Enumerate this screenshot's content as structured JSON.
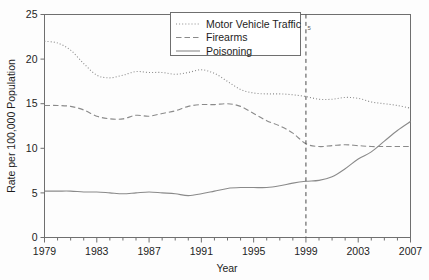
{
  "chart_data": {
    "type": "line",
    "title": "",
    "xlabel": "Year",
    "ylabel": "Rate per 100,000 Population",
    "xlim": [
      1979,
      2007
    ],
    "ylim": [
      0,
      25
    ],
    "grid": false,
    "legend_position": "top-center",
    "y_ticks": [
      "0",
      "5",
      "10",
      "15",
      "20",
      "25"
    ],
    "x_ticks_major": [
      "1979",
      "1983",
      "1987",
      "1991",
      "1995",
      "1999",
      "2003",
      "2007"
    ],
    "x_minor_tick_step": 1,
    "x": [
      1979,
      1980,
      1981,
      1982,
      1983,
      1984,
      1985,
      1986,
      1987,
      1988,
      1989,
      1990,
      1991,
      1992,
      1993,
      1994,
      1995,
      1996,
      1997,
      1998,
      1999,
      2000,
      2001,
      2002,
      2003,
      2004,
      2005,
      2006,
      2007
    ],
    "series": [
      {
        "name": "Motor Vehicle Traffic",
        "style": "dotted",
        "color": "#8a8a8a",
        "values": [
          22.0,
          21.8,
          21.0,
          19.5,
          18.2,
          17.9,
          18.2,
          18.6,
          18.5,
          18.5,
          18.3,
          18.5,
          18.8,
          18.4,
          17.5,
          16.6,
          16.2,
          16.1,
          16.1,
          16.0,
          15.8,
          15.5,
          15.5,
          15.7,
          15.6,
          15.2,
          15.0,
          14.8,
          14.5
        ]
      },
      {
        "name": "Firearms",
        "style": "dashed",
        "color": "#8a8a8a",
        "values": [
          14.8,
          14.8,
          14.7,
          14.3,
          13.6,
          13.3,
          13.3,
          13.7,
          13.6,
          13.9,
          14.2,
          14.7,
          14.9,
          14.9,
          15.0,
          14.7,
          13.9,
          13.1,
          12.5,
          11.7,
          10.5,
          10.2,
          10.3,
          10.4,
          10.3,
          10.2,
          10.2,
          10.2,
          10.2
        ]
      },
      {
        "name": "Poisoning",
        "style": "solid",
        "color": "#8a8a8a",
        "values": [
          5.2,
          5.2,
          5.2,
          5.1,
          5.1,
          5.0,
          4.9,
          5.0,
          5.1,
          5.0,
          4.9,
          4.7,
          4.9,
          5.2,
          5.5,
          5.6,
          5.6,
          5.6,
          5.8,
          6.1,
          6.3,
          6.4,
          6.8,
          7.7,
          8.8,
          9.6,
          10.8,
          12.0,
          13.0
        ]
      }
    ],
    "annotations": [
      {
        "name": "reference-line",
        "type": "vline",
        "x": 1999,
        "label": "5",
        "style": "dashed"
      }
    ]
  }
}
